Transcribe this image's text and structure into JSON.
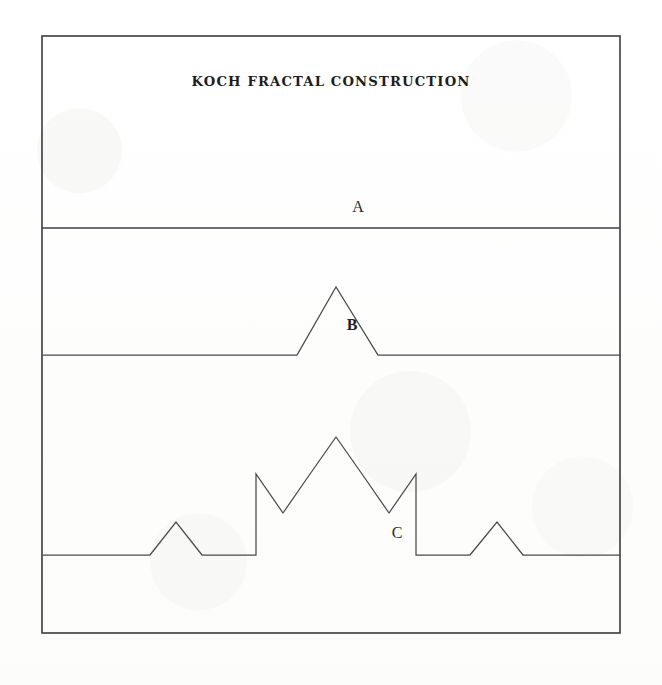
{
  "figure": {
    "title": "KOCH FRACTAL CONSTRUCTION",
    "background_color": "#fdfdfc",
    "line_color": "#4a4a4a",
    "frame_color": "#3b3b3b",
    "frame": {
      "x": 42,
      "y": 36,
      "width": 578,
      "height": 597
    }
  },
  "labels": {
    "stage_a": "A",
    "stage_b": "B",
    "stage_c": "C"
  },
  "chart_data": {
    "type": "line",
    "title": "KOCH FRACTAL CONSTRUCTION",
    "xlabel": "",
    "ylabel": "",
    "grid": false,
    "legend": "none",
    "axis_ranges": {
      "x": [
        42,
        620
      ],
      "y": [
        36,
        633
      ]
    },
    "stages": [
      {
        "name": "A",
        "iteration": 0,
        "label": "A",
        "label_position": {
          "x": 358,
          "y": 212
        },
        "baseline_y": 228,
        "segment_count": 1,
        "points": [
          [
            42,
            228
          ],
          [
            620,
            228
          ]
        ]
      },
      {
        "name": "B",
        "iteration": 1,
        "label": "B",
        "label_position": {
          "x": 352,
          "y": 330
        },
        "baseline_y": 355,
        "apex_y": 287,
        "segment_count": 4,
        "points": [
          [
            42,
            355
          ],
          [
            297,
            355
          ],
          [
            336,
            287
          ],
          [
            378,
            355
          ],
          [
            620,
            355
          ]
        ]
      },
      {
        "name": "C",
        "iteration": 2,
        "label": "C",
        "label_position": {
          "x": 397,
          "y": 538
        },
        "baseline_y": 555,
        "apex_y": 437,
        "shoulder_y": 474,
        "small_apex_y": 522,
        "notch_y": 513,
        "segment_count": 16,
        "points": [
          [
            42,
            555
          ],
          [
            150,
            555
          ],
          [
            176,
            522
          ],
          [
            202,
            555
          ],
          [
            256,
            555
          ],
          [
            256,
            474
          ],
          [
            283,
            513
          ],
          [
            310,
            474
          ],
          [
            336,
            437
          ],
          [
            362,
            474
          ],
          [
            389,
            513
          ],
          [
            416,
            474
          ],
          [
            416,
            555
          ],
          [
            470,
            555
          ],
          [
            497,
            522
          ],
          [
            523,
            555
          ],
          [
            620,
            555
          ]
        ]
      }
    ],
    "panels": [
      {
        "index": 1,
        "top": 36,
        "bottom": 228,
        "contains": "A"
      },
      {
        "index": 2,
        "top": 228,
        "bottom": 355,
        "contains": "B"
      },
      {
        "index": 3,
        "top": 355,
        "bottom": 555,
        "contains": "C"
      },
      {
        "index": 4,
        "top": 555,
        "bottom": 633,
        "contains": ""
      }
    ]
  }
}
